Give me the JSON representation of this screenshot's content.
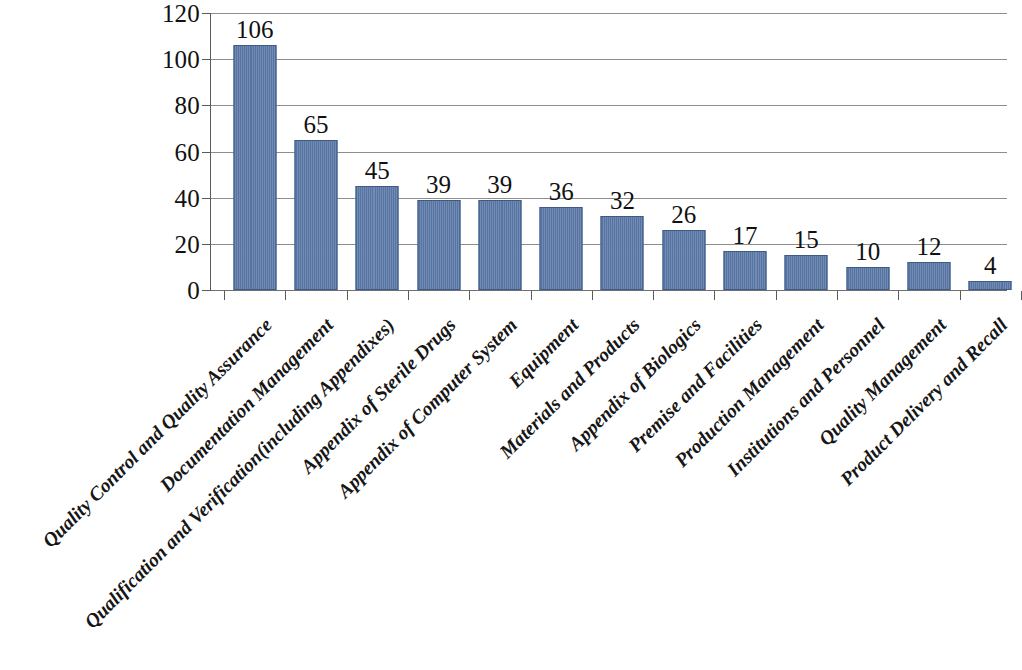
{
  "chart_data": {
    "type": "bar",
    "title": "",
    "subtitle": "",
    "xlabel": "",
    "ylabel": "",
    "ylim": [
      0,
      120
    ],
    "y_ticks": [
      0,
      20,
      40,
      60,
      80,
      100,
      120
    ],
    "grid": true,
    "legend": false,
    "legend_position": "none",
    "orientation": "vertical",
    "bar_color": "#5c7aa9",
    "bar_border_color": "#3f5a86",
    "gridline_color": "#8d8d8d",
    "axis_color": "#5a5a5a",
    "background_color": "#ffffff",
    "data_labels_shown": true,
    "categories": [
      "Quality Control and Quality Assurance",
      "Documentation Management",
      "Qualification and Verification(including Appendixes)",
      "Appendix of Sterile Drugs",
      "Appendix of Computer System",
      "Equipment",
      "Materials and Products",
      "Appendix of Biologics",
      "Premise and Facilities",
      "Production Management",
      "Institutions and Personnel",
      "Quality Management",
      "Product Delivery and Recall"
    ],
    "values": [
      106,
      65,
      45,
      39,
      39,
      36,
      32,
      26,
      17,
      15,
      10,
      12,
      4
    ],
    "value_labels": [
      "106",
      "65",
      "45",
      "39",
      "39",
      "36",
      "32",
      "26",
      "17",
      "15",
      "10",
      "12",
      "4"
    ],
    "y_tick_labels": [
      "0",
      "20",
      "40",
      "60",
      "80",
      "100",
      "120"
    ]
  }
}
